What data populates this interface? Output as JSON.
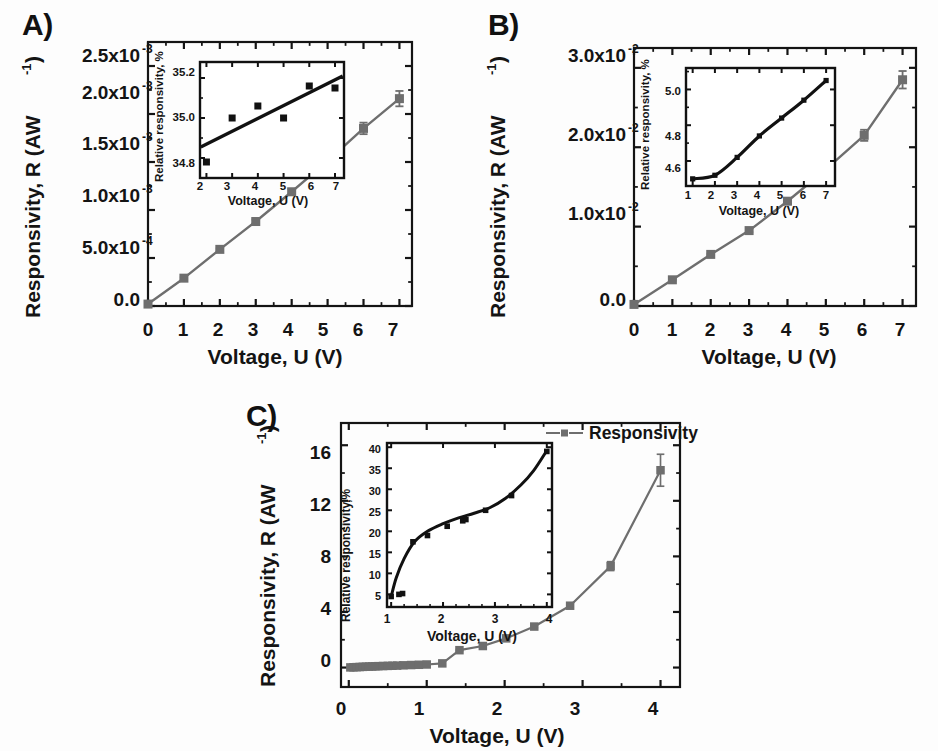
{
  "figure": {
    "background": "#fdfdfd",
    "panel_letters": [
      "A)",
      "B)",
      "C)"
    ],
    "series_color": "#6e6e6e",
    "inset_color": "#111111",
    "axis_color": "#141414"
  },
  "panels": [
    {
      "id": "A",
      "letter": "A)",
      "xlabel": "Voltage, U (V)",
      "ylabel_main": "Responsivity, R (AW",
      "ylabel_exp": "-1",
      "ylabel_close": ")",
      "xticks": [
        "0",
        "1",
        "2",
        "3",
        "4",
        "5",
        "6",
        "7"
      ],
      "yticks": [
        "0.0",
        "5.0x10",
        "1.0x10",
        "1.5x10",
        "2.0x10",
        "2.5x10"
      ],
      "yexps": [
        "",
        "-4",
        "-3",
        "-3",
        "-3",
        "-3"
      ],
      "inset": {
        "xlabel": "Voltage, U (V)",
        "ylabel": "Relative responsivity, %",
        "xticks": [
          "2",
          "3",
          "4",
          "5",
          "6",
          "7"
        ],
        "yticks": [
          "34.8",
          "35.0",
          "35.2"
        ]
      }
    },
    {
      "id": "B",
      "letter": "B)",
      "xlabel": "Voltage, U (V)",
      "ylabel_main": "Responsivity, R (AW",
      "ylabel_exp": "-1",
      "ylabel_close": ")",
      "xticks": [
        "0",
        "1",
        "2",
        "3",
        "4",
        "5",
        "6",
        "7"
      ],
      "yticks": [
        "0.0",
        "1.0x10",
        "2.0x10",
        "3.0x10"
      ],
      "yexps": [
        "",
        "-2",
        "-2",
        "-2"
      ],
      "inset": {
        "xlabel": "Voltage, U (V)",
        "ylabel": "Relative responsivity, %",
        "xticks": [
          "1",
          "2",
          "3",
          "4",
          "5",
          "6",
          "7"
        ],
        "yticks": [
          "4.6",
          "4.8",
          "5.0"
        ]
      }
    },
    {
      "id": "C",
      "letter": "C)",
      "xlabel": "Voltage, U (V)",
      "ylabel_main": "Responsivity, R (AW",
      "ylabel_exp": "-1",
      "ylabel_close": ")",
      "xticks": [
        "0",
        "1",
        "2",
        "3",
        "4"
      ],
      "yticks": [
        "0",
        "4",
        "8",
        "12",
        "16"
      ],
      "legend_label": "Responsivity",
      "inset": {
        "xlabel": "Voltage, U (V)",
        "ylabel": "Relative responsivity,%",
        "xticks": [
          "1",
          "2",
          "3",
          "4"
        ],
        "yticks": [
          "5",
          "10",
          "15",
          "20",
          "25",
          "30",
          "35",
          "40"
        ]
      }
    }
  ],
  "chart_data": [
    {
      "type": "line",
      "panel": "A",
      "title": "",
      "xlabel": "Voltage, U (V)",
      "ylabel": "Responsivity, R (AW -1)",
      "xlim": [
        0,
        7.35
      ],
      "ylim": [
        0,
        0.00275
      ],
      "grid": false,
      "legend": "none",
      "series": [
        {
          "name": "Responsivity",
          "x": [
            0,
            1,
            2,
            3,
            4,
            5,
            6,
            7
          ],
          "y": [
            2e-05,
            0.00029,
            0.00059,
            0.00088,
            0.00119,
            0.00151,
            0.00185,
            0.00216
          ],
          "yerr": [
            0.0,
            1e-05,
            1e-05,
            2e-05,
            3e-05,
            5e-05,
            6e-05,
            8e-05
          ]
        }
      ],
      "inset": {
        "type": "scatter",
        "xlabel": "Voltage, U (V)",
        "ylabel": "Relative responsivity, %",
        "xlim": [
          1.75,
          7.35
        ],
        "ylim": [
          34.7,
          35.28
        ],
        "x": [
          2,
          3,
          4,
          5,
          6,
          7
        ],
        "y": [
          34.78,
          35.0,
          35.06,
          35.0,
          35.16,
          35.15
        ],
        "fitline": {
          "x": [
            1.78,
            7.3
          ],
          "y": [
            34.855,
            35.21
          ]
        }
      }
    },
    {
      "type": "line",
      "panel": "B",
      "title": "",
      "xlabel": "Voltage, U (V)",
      "ylabel": "Responsivity, R (AW -1)",
      "xlim": [
        0,
        7.35
      ],
      "ylim": [
        0,
        0.0325
      ],
      "grid": false,
      "legend": "none",
      "series": [
        {
          "name": "Responsivity",
          "x": [
            0,
            1,
            2,
            3,
            4,
            5,
            6,
            7
          ],
          "y": [
            0.0002,
            0.0033,
            0.0065,
            0.0095,
            0.0132,
            0.0172,
            0.0215,
            0.0285
          ],
          "yerr": [
            0.0,
            0.0001,
            0.0001,
            0.0002,
            0.0003,
            0.0005,
            0.0007,
            0.0011
          ]
        }
      ],
      "inset": {
        "type": "line",
        "xlabel": "Voltage, U (V)",
        "ylabel": "Relative responsivity, %",
        "xlim": [
          0.7,
          7.4
        ],
        "ylim": [
          4.46,
          5.12
        ],
        "x": [
          1,
          2,
          3,
          4,
          5,
          6,
          7
        ],
        "y": [
          4.5,
          4.52,
          4.62,
          4.74,
          4.84,
          4.94,
          5.05
        ]
      }
    },
    {
      "type": "line",
      "panel": "C",
      "title": "",
      "xlabel": "Voltage, U (V)",
      "ylabel": "Responsivity, R (AW -1)",
      "xlim": [
        -0.1,
        4.25
      ],
      "ylim": [
        -1.4,
        17.6
      ],
      "grid": false,
      "legend": "Responsivity",
      "series": [
        {
          "name": "Responsivity",
          "x": [
            0.02,
            0.06,
            0.1,
            0.14,
            0.18,
            0.22,
            0.26,
            0.3,
            0.34,
            0.38,
            0.44,
            0.5,
            0.56,
            0.62,
            0.7,
            0.8,
            0.9,
            1.0,
            1.2,
            1.42,
            1.72,
            2.02,
            2.38,
            2.84,
            3.36,
            4.0
          ],
          "y": [
            0.01,
            0.02,
            0.03,
            0.04,
            0.05,
            0.06,
            0.07,
            0.08,
            0.09,
            0.1,
            0.11,
            0.12,
            0.13,
            0.14,
            0.16,
            0.18,
            0.2,
            0.22,
            0.3,
            1.25,
            1.55,
            2.1,
            2.95,
            4.45,
            7.3,
            14.2
          ],
          "yerr": [
            0,
            0,
            0,
            0,
            0,
            0,
            0,
            0,
            0,
            0,
            0,
            0,
            0,
            0,
            0,
            0,
            0,
            0,
            0,
            0.05,
            0.05,
            0.06,
            0.08,
            0.12,
            0.32,
            1.15
          ]
        }
      ],
      "inset": {
        "type": "line",
        "xlabel": "Voltage, U (V)",
        "ylabel": "Relative responsivity,%",
        "xlim": [
          0.92,
          4.1
        ],
        "ylim": [
          2,
          41
        ],
        "x": [
          1.0,
          1.15,
          1.22,
          1.42,
          1.7,
          2.08,
          2.38,
          2.44,
          2.82,
          3.32,
          4.0
        ],
        "y": [
          4.5,
          5.0,
          5.2,
          17.5,
          19.0,
          21.2,
          22.5,
          22.8,
          25.0,
          28.5,
          39.0
        ],
        "fit_x": [
          1.0,
          1.1,
          1.25,
          1.45,
          1.7,
          2.0,
          2.3,
          2.6,
          2.9,
          3.2,
          3.5,
          3.75,
          4.0
        ],
        "fit_y": [
          4.5,
          9.0,
          13.5,
          17.5,
          20.0,
          21.8,
          23.2,
          24.3,
          25.6,
          27.8,
          31.0,
          34.5,
          39.2
        ]
      }
    }
  ]
}
